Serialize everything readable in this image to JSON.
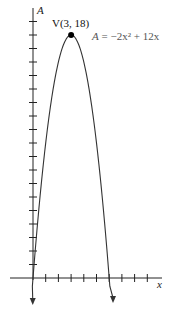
{
  "chart_data": {
    "type": "line",
    "title": "",
    "xlabel": "x",
    "ylabel": "A",
    "function": "A = -2x^2 + 12x",
    "series": [
      {
        "name": "A = −2x² + 12x",
        "x": [
          -0.1,
          0,
          0.5,
          1,
          1.5,
          2,
          2.5,
          3,
          3.5,
          4,
          4.5,
          5,
          5.5,
          6,
          6.2
        ],
        "values": [
          -1.22,
          0,
          5.5,
          10,
          13.5,
          16,
          17.5,
          18,
          17.5,
          16,
          13.5,
          10,
          5.5,
          0,
          -2.48
        ]
      }
    ],
    "annotations": [
      {
        "text": "V(3, 18)",
        "x": 3,
        "y": 18,
        "kind": "vertex-point"
      },
      {
        "text": "A = −2x² + 12x",
        "kind": "equation-label"
      }
    ],
    "xlim": [
      0,
      10
    ],
    "ylim": [
      0,
      19
    ],
    "x_tick_count": 9,
    "y_tick_count": 19,
    "grid": false,
    "legend": "none"
  },
  "labels": {
    "y_axis": "A",
    "x_axis": "x",
    "vertex": "V(3, 18)",
    "equation_A": "A",
    "equation_rest": " = −2x² + 12x"
  },
  "colors": {
    "axis": "#222222",
    "curve": "#333333",
    "vertex_dot": "#000000",
    "equation_text": "#555555"
  }
}
